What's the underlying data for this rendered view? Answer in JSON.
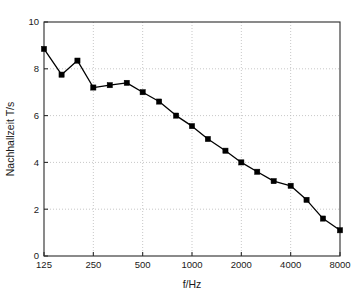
{
  "chart_data": {
    "type": "line",
    "title": "",
    "subtitle": "",
    "xlabel": "f/Hz",
    "ylabel": "Nachhallzeit T/s",
    "xscale": "log",
    "yscale": "linear",
    "xlim": [
      125,
      8000
    ],
    "ylim": [
      0,
      10
    ],
    "grid": true,
    "legend": null,
    "legend_position": "none",
    "xticks": [
      125,
      250,
      500,
      1000,
      2000,
      4000,
      8000
    ],
    "xtick_labels": [
      "125",
      "250",
      "500",
      "1000",
      "2000",
      "4000",
      "8000"
    ],
    "yticks": [
      0,
      2,
      4,
      6,
      8,
      10
    ],
    "ytick_labels": [
      "0",
      "2",
      "4",
      "6",
      "8",
      "10"
    ],
    "marker": "square-filled",
    "line_color": "#000000",
    "marker_color": "#000000",
    "grid_color": "#b9b9b9",
    "axis_color": "#2b2b2b",
    "series": [
      {
        "name": "Nachhallzeit",
        "x": [
          125,
          160,
          200,
          250,
          315,
          400,
          500,
          630,
          800,
          1000,
          1250,
          1600,
          2000,
          2500,
          3150,
          4000,
          5000,
          6300,
          8000
        ],
        "values": [
          8.85,
          7.75,
          8.35,
          7.2,
          7.3,
          7.4,
          7.0,
          6.6,
          6.0,
          5.55,
          5.0,
          4.5,
          4.0,
          3.6,
          3.2,
          3.0,
          2.4,
          1.6,
          1.1
        ]
      }
    ]
  }
}
